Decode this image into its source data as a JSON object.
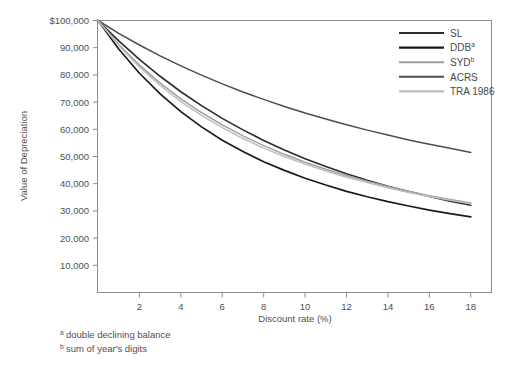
{
  "chart_data": {
    "type": "line",
    "title": "",
    "xlabel": "Discount rate (%)",
    "ylabel": "Value of Depreciation",
    "xlim": [
      0,
      19
    ],
    "ylim": [
      0,
      100000
    ],
    "grid": false,
    "legend_position": "top-right",
    "xticks": [
      2,
      4,
      6,
      8,
      10,
      12,
      14,
      16,
      18
    ],
    "xtick_labels": [
      "2",
      "4",
      "6",
      "8",
      "10",
      "12",
      "14",
      "16",
      "18"
    ],
    "yticks": [
      10000,
      20000,
      30000,
      40000,
      50000,
      60000,
      70000,
      80000,
      90000,
      100000
    ],
    "ytick_labels": [
      "10,000",
      "20,000",
      "30,000",
      "40,000",
      "50,000",
      "60,000",
      "70,000",
      "80,000",
      "90,000",
      "$100,000"
    ],
    "x": [
      0,
      1,
      2,
      3,
      4,
      5,
      6,
      7,
      8,
      9,
      10,
      11,
      12,
      13,
      14,
      15,
      16,
      17,
      18
    ],
    "series": [
      {
        "name": "SL",
        "label": "SL",
        "superscript": "",
        "color": "#2b2b2b",
        "width": 1.6,
        "values": [
          100000,
          92500,
          85700,
          79500,
          73800,
          68700,
          64000,
          59800,
          55900,
          52400,
          49200,
          46300,
          43700,
          41300,
          39100,
          37100,
          35300,
          33600,
          32100
        ]
      },
      {
        "name": "DDB",
        "label": "DDB",
        "superscript": "a",
        "color": "#1a1a1a",
        "width": 1.7,
        "values": [
          100000,
          89500,
          80600,
          73000,
          66500,
          60900,
          56000,
          51800,
          48100,
          44900,
          42000,
          39500,
          37200,
          35200,
          33400,
          31800,
          30300,
          29000,
          27800
        ]
      },
      {
        "name": "SYD",
        "label": "SYD",
        "superscript": "b",
        "color": "#9e9e9e",
        "width": 1.5,
        "values": [
          100000,
          91200,
          83600,
          77000,
          71200,
          66100,
          61600,
          57600,
          54000,
          50800,
          47900,
          45300,
          43000,
          40900,
          39000,
          37200,
          35600,
          34200,
          32900
        ]
      },
      {
        "name": "ACRS",
        "label": "ACRS",
        "superscript": "",
        "color": "#4d4d4d",
        "width": 1.5,
        "values": [
          100000,
          95300,
          91000,
          87000,
          83300,
          79900,
          76700,
          73700,
          71000,
          68400,
          66000,
          63800,
          61700,
          59700,
          57900,
          56100,
          54500,
          53000,
          51500
        ]
      },
      {
        "name": "TRA 1986",
        "label": "TRA 1986",
        "superscript": "",
        "color": "#bdbdbd",
        "width": 1.5,
        "values": [
          100000,
          90800,
          82900,
          76100,
          70200,
          65100,
          60600,
          56600,
          53100,
          50000,
          47200,
          44700,
          42400,
          40400,
          38500,
          36800,
          35300,
          33900,
          32600
        ]
      }
    ],
    "footnotes": [
      {
        "marker": "a",
        "text": "double declining balance"
      },
      {
        "marker": "b",
        "text": "sum of year's digits"
      }
    ]
  },
  "axis": {
    "y_title": "Value of Depreciation",
    "x_title": "Discount rate (%)"
  },
  "colors": {
    "frame": "#8d8d8d",
    "text": "#4f4f4f",
    "background": "#ffffff"
  }
}
